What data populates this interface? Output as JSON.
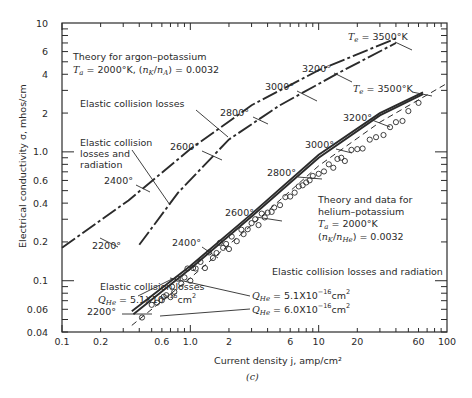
{
  "chart_data": {
    "type": "line",
    "title": "",
    "caption": "(c)",
    "xlabel": "Current density j, amp/cm²",
    "ylabel": "Electrical conductivity σ, mhos/cm",
    "xscale": "log",
    "yscale": "log",
    "xlim": [
      0.1,
      100
    ],
    "ylim": [
      0.04,
      10
    ],
    "grid": false,
    "x_ticks": [
      {
        "v": 0.1,
        "label": "0.1"
      },
      {
        "v": 0.2,
        "label": "0.2"
      },
      {
        "v": 0.6,
        "label": "0.6"
      },
      {
        "v": 1.0,
        "label": "1.0"
      },
      {
        "v": 2,
        "label": "2"
      },
      {
        "v": 6,
        "label": "6"
      },
      {
        "v": 10,
        "label": "10"
      },
      {
        "v": 20,
        "label": "20"
      },
      {
        "v": 60,
        "label": "60"
      },
      {
        "v": 100,
        "label": "100"
      }
    ],
    "y_ticks": [
      {
        "v": 0.04,
        "label": "0.04"
      },
      {
        "v": 0.06,
        "label": "0.06"
      },
      {
        "v": 0.1,
        "label": "0.1"
      },
      {
        "v": 0.2,
        "label": "0.2"
      },
      {
        "v": 0.4,
        "label": "0.4"
      },
      {
        "v": 0.6,
        "label": "0.6"
      },
      {
        "v": 1.0,
        "label": "1.0"
      },
      {
        "v": 2,
        "label": "2"
      },
      {
        "v": 4,
        "label": "4"
      },
      {
        "v": 6,
        "label": "6"
      },
      {
        "v": 10,
        "label": "10"
      }
    ],
    "series": [
      {
        "name": "Argon-potassium, elastic collision losses",
        "group": "argon-potassium",
        "style": "dash-dot",
        "x": [
          0.1,
          0.33,
          1.0,
          3.0,
          10,
          40
        ],
        "y": [
          0.18,
          0.42,
          1.05,
          2.3,
          4.3,
          7.6
        ]
      },
      {
        "name": "Argon-potassium, elastic collision losses and radiation",
        "group": "argon-potassium",
        "style": "dash-dot",
        "x": [
          0.4,
          0.8,
          2.0,
          5.0,
          15,
          40
        ],
        "y": [
          0.19,
          0.48,
          1.25,
          2.3,
          4.2,
          7.0
        ]
      },
      {
        "name": "Helium-potassium theory, Q_He = 5.1x10^-16 cm^2 (elastic collision losses)",
        "group": "helium-potassium",
        "style": "solid",
        "x": [
          0.35,
          1.0,
          3.0,
          10,
          30,
          65
        ],
        "y": [
          0.058,
          0.13,
          0.33,
          0.95,
          2.0,
          2.9
        ]
      },
      {
        "name": "Helium-potassium theory, Q_He = 5.1x10^-16 cm^2 (elastic collision losses and radiation)",
        "group": "helium-potassium",
        "style": "solid",
        "x": [
          0.36,
          1.0,
          3.0,
          10,
          30,
          65
        ],
        "y": [
          0.055,
          0.124,
          0.315,
          0.9,
          1.92,
          2.8
        ]
      },
      {
        "name": "Helium-potassium theory, Q_He = 6.0x10^-16 cm^2",
        "group": "helium-potassium",
        "style": "dashed",
        "x": [
          0.35,
          1.0,
          3.0,
          10,
          30,
          100
        ],
        "y": [
          0.045,
          0.105,
          0.27,
          0.78,
          1.7,
          3.4
        ]
      },
      {
        "name": "Helium-potassium experimental data",
        "group": "helium-potassium",
        "style": "circles",
        "x": [
          0.42,
          0.5,
          0.55,
          0.6,
          0.62,
          0.65,
          0.7,
          0.72,
          0.75,
          0.8,
          0.85,
          0.9,
          0.95,
          1.0,
          1.05,
          1.1,
          1.2,
          1.3,
          1.4,
          1.5,
          1.6,
          1.7,
          1.8,
          1.9,
          2.0,
          2.1,
          2.3,
          2.5,
          2.6,
          2.8,
          3.0,
          3.2,
          3.4,
          3.6,
          3.8,
          4.0,
          4.3,
          4.5,
          5.0,
          5.5,
          6.0,
          6.5,
          7.0,
          7.5,
          8.0,
          8.5,
          9.0,
          10,
          11,
          12,
          13,
          14,
          15,
          16,
          18,
          20,
          22,
          25,
          28,
          32,
          36,
          40,
          45,
          50,
          60
        ],
        "y": [
          0.05,
          0.065,
          0.07,
          0.068,
          0.075,
          0.08,
          0.072,
          0.09,
          0.085,
          0.1,
          0.095,
          0.11,
          0.12,
          0.1,
          0.13,
          0.12,
          0.14,
          0.13,
          0.16,
          0.15,
          0.17,
          0.19,
          0.18,
          0.2,
          0.17,
          0.22,
          0.21,
          0.24,
          0.23,
          0.26,
          0.27,
          0.3,
          0.28,
          0.32,
          0.31,
          0.35,
          0.33,
          0.37,
          0.4,
          0.43,
          0.45,
          0.5,
          0.52,
          0.55,
          0.6,
          0.58,
          0.65,
          0.7,
          0.68,
          0.8,
          0.78,
          0.85,
          0.9,
          0.88,
          1.0,
          1.05,
          1.1,
          1.2,
          1.3,
          1.4,
          1.5,
          1.7,
          1.8,
          2.0,
          2.4
        ]
      }
    ],
    "annotations": [
      {
        "text": "Theory for argon–potassium",
        "x": 73,
        "y": 60
      },
      {
        "text": "Elastic collision losses",
        "x": 80,
        "y": 107
      },
      {
        "text": "Elastic collision",
        "x": 80,
        "y": 146
      },
      {
        "text": "losses and",
        "x": 80,
        "y": 157
      },
      {
        "text": "radiation",
        "x": 80,
        "y": 168
      },
      {
        "text": "Theory and data for",
        "x": 318,
        "y": 203
      },
      {
        "text": "helium–potassium",
        "x": 318,
        "y": 215
      },
      {
        "text": "Elastic collision losses and radiation",
        "x": 272,
        "y": 275
      },
      {
        "text": "Elastic collision losses",
        "x": 100,
        "y": 290
      }
    ],
    "argon_params": {
      "line1_prefix": "T",
      "line1_sub": "a",
      "line1_rest": " = 2000°K, (n",
      "line1_sub2": "K",
      "line1_mid": "/n",
      "line1_sub3": "A",
      "line1_end": ") = 0.0032"
    },
    "helium_params": {
      "ta": "Tₐ = 2000°K",
      "ratio": "(nₖ/nₕₑ) = 0.0032"
    },
    "q_labels": {
      "left": "Qₕₑ = 5.1X10⁻¹⁶cm²",
      "right_1": "Qₕₑ = 5.1X10⁻¹⁶cm²",
      "right_2": "Qₕₑ = 6.0X10⁻¹⁶cm²"
    },
    "temperature_labels": [
      {
        "text": "Te = 3500°K",
        "x": 348,
        "y": 40,
        "group": "argon"
      },
      {
        "text": "3200°",
        "x": 302,
        "y": 72,
        "group": "argon"
      },
      {
        "text": "3000°",
        "x": 265,
        "y": 90,
        "group": "argon"
      },
      {
        "text": "2800°",
        "x": 220,
        "y": 116,
        "group": "argon"
      },
      {
        "text": "2600°",
        "x": 170,
        "y": 150,
        "group": "argon"
      },
      {
        "text": "2400°",
        "x": 104,
        "y": 184,
        "group": "argon"
      },
      {
        "text": "2200°",
        "x": 92,
        "y": 249,
        "group": "argon"
      },
      {
        "text": "Te = 3500°K",
        "x": 353,
        "y": 92,
        "group": "helium"
      },
      {
        "text": "3200°",
        "x": 343,
        "y": 121,
        "group": "helium"
      },
      {
        "text": "3000°",
        "x": 305,
        "y": 148,
        "group": "helium"
      },
      {
        "text": "2800°",
        "x": 267,
        "y": 176,
        "group": "helium"
      },
      {
        "text": "2600°",
        "x": 225,
        "y": 216,
        "group": "helium"
      },
      {
        "text": "2400°",
        "x": 172,
        "y": 246,
        "group": "helium"
      },
      {
        "text": "2200°",
        "x": 87,
        "y": 315,
        "group": "helium"
      }
    ]
  }
}
